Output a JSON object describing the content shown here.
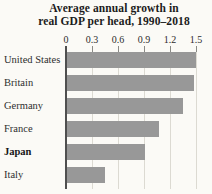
{
  "figure": {
    "title_line1": "Average annual growth in",
    "title_line2": "real GDP per head, 1990–2018"
  },
  "chart_data": {
    "type": "bar",
    "orientation": "horizontal",
    "title": "Average annual growth in real GDP per head, 1990–2018",
    "categories": [
      "United States",
      "Britain",
      "Germany",
      "France",
      "Japan",
      "Italy"
    ],
    "values": [
      1.5,
      1.48,
      1.35,
      1.07,
      0.91,
      0.45
    ],
    "emphasized_category": "Japan",
    "x_axis_position": "top",
    "x_tick_labels": [
      "0",
      "0.3",
      "0.6",
      "0.9",
      "1.2",
      "1.5"
    ],
    "x_ticks": [
      0,
      0.3,
      0.6,
      0.9,
      1.2,
      1.5
    ],
    "xlim": [
      0,
      1.5
    ],
    "grid": true,
    "legend": false,
    "bar_color": "#989898",
    "axis_line_color": "#4f4f4f",
    "gridline_color": "#dcdad2",
    "background_color": "#fbfaf6"
  }
}
